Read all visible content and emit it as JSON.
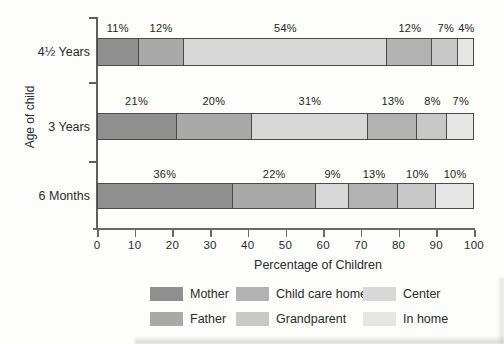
{
  "axes": {
    "x_label": "Percentage of Children",
    "y_label": "Age of child"
  },
  "chart_data": {
    "type": "bar",
    "orientation": "horizontal",
    "stacked": true,
    "title": "",
    "xlabel": "Percentage of Children",
    "ylabel": "Age of child",
    "xlim": [
      0,
      100
    ],
    "x_ticks": [
      0,
      10,
      20,
      30,
      40,
      50,
      60,
      70,
      80,
      90,
      100
    ],
    "categories": [
      "4½ Years",
      "3 Years",
      "6 Months"
    ],
    "series": [
      {
        "name": "Mother",
        "values": [
          11,
          21,
          36
        ]
      },
      {
        "name": "Father",
        "values": [
          12,
          20,
          22
        ]
      },
      {
        "name": "Center",
        "values": [
          54,
          31,
          9
        ]
      },
      {
        "name": "Child care home",
        "values": [
          12,
          13,
          13
        ]
      },
      {
        "name": "Grandparent",
        "values": [
          7,
          8,
          10
        ]
      },
      {
        "name": "In home",
        "values": [
          4,
          7,
          10
        ]
      }
    ],
    "data_label_format": "{value}%",
    "legend_position": "bottom",
    "grid": false
  },
  "legend": {
    "items": [
      {
        "label": "Mother"
      },
      {
        "label": "Father"
      },
      {
        "label": "Child care home"
      },
      {
        "label": "Grandparent"
      },
      {
        "label": "Center"
      },
      {
        "label": "In home"
      }
    ]
  },
  "colors": {
    "series": {
      "Mother": "#8f8f8f",
      "Father": "#a9a9a9",
      "Center": "#d8d8d8",
      "Child care home": "#b2b2b2",
      "Grandparent": "#c8c8c8",
      "In home": "#e5e5e5"
    },
    "bar_border": "#4a4a4a",
    "axis": "#5f5f5f",
    "text": "#2b2b2b",
    "background": "#fdfdfb"
  }
}
